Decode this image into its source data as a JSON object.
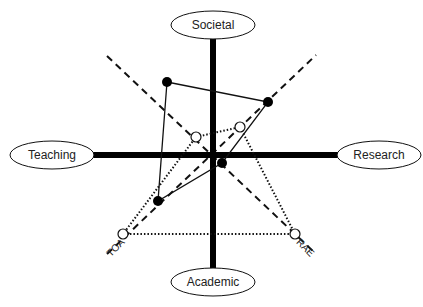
{
  "diagram": {
    "axes": {
      "top": "Societal",
      "left": "Teaching",
      "right": "Research",
      "bottom": "Academic"
    },
    "diagonal_labels": {
      "bottom_left": "TOA",
      "bottom_right": "RAE"
    },
    "shapes": {
      "solid_quadrilateral": {
        "style": "solid line, filled dots",
        "points": [
          [
            167,
            82
          ],
          [
            268,
            102
          ],
          [
            222,
            163
          ],
          [
            158,
            201
          ]
        ]
      },
      "dotted_quadrilateral": {
        "style": "dotted line, open circles",
        "points": [
          [
            196,
            137
          ],
          [
            240,
            127
          ],
          [
            295,
            234
          ],
          [
            123,
            234
          ]
        ]
      }
    },
    "colors": {
      "line": "#111111",
      "background": "#ffffff"
    }
  }
}
